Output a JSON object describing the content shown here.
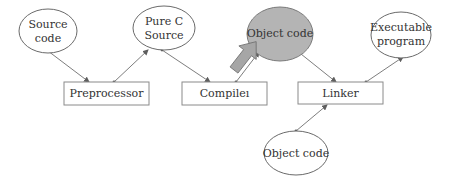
{
  "diagram": {
    "title": "",
    "colors": {
      "background": "#ffffff",
      "highlight_fill": "#b4b4b4",
      "stroke": "#6a6a6a",
      "pointer_arrow": "#a6a6a6"
    },
    "nodes": {
      "source_code": {
        "shape": "ellipse",
        "line1": "Source",
        "line2": "code"
      },
      "pure_c_source": {
        "shape": "ellipse",
        "line1": "Pure C",
        "line2": "Source"
      },
      "object_code_top": {
        "shape": "ellipse",
        "label": "Object code",
        "highlighted": true
      },
      "executable_program": {
        "shape": "ellipse",
        "line1": "Executable",
        "line2": "program"
      },
      "preprocessor": {
        "shape": "box",
        "label": "Preprocessor"
      },
      "compiler": {
        "shape": "box",
        "label": "Compileı"
      },
      "linker": {
        "shape": "box",
        "label": "Linker"
      },
      "object_code_bottom": {
        "shape": "ellipse",
        "label": "Object code"
      }
    },
    "edges": [
      {
        "from": "Source code",
        "to": "Preprocessor"
      },
      {
        "from": "Preprocessor",
        "to": "Pure C Source"
      },
      {
        "from": "Pure C Source",
        "to": "Compiler"
      },
      {
        "from": "Compiler",
        "to": "Object code"
      },
      {
        "from": "Object code",
        "to": "Linker"
      },
      {
        "from": "Linker",
        "to": "Executable program"
      },
      {
        "from": "Object code (library)",
        "to": "Linker"
      }
    ],
    "pointer": {
      "icon": "block-arrow-icon",
      "target": "Object code"
    }
  }
}
